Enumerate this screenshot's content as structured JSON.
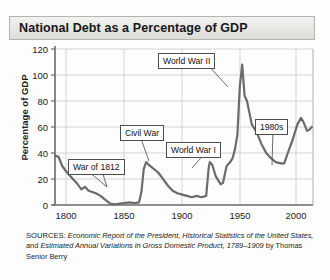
{
  "title": "National Debt as a Percentage of GDP",
  "axes": {
    "ylabel": "Percentage of GDP",
    "yticks": [
      "0",
      "20",
      "40",
      "60",
      "80",
      "100",
      "120"
    ],
    "xticks": [
      "1800",
      "1850",
      "1900",
      "1950",
      "2000"
    ]
  },
  "annotations": [
    {
      "id": "war-of-1812",
      "label": "War of 1812"
    },
    {
      "id": "civil-war",
      "label": "Civil War"
    },
    {
      "id": "world-war-i",
      "label": "World War I"
    },
    {
      "id": "world-war-ii",
      "label": "World War II"
    },
    {
      "id": "nineteen-eighties",
      "label": "1980s"
    }
  ],
  "sources": {
    "label": "SOURCES:",
    "item1": "Economic Report of the President, Historical Statistics of the United States,",
    "conj": " and ",
    "item2": "Estimated Annual Variations in Gross Domestic Product, 1789–1909",
    "tail": " by Thomas Senior Berry"
  },
  "colors": {
    "line": "#6b6b6b",
    "grid": "#c9c9c9",
    "axis": "#6a6a6a",
    "frame": "#9a9a9a",
    "title_text": "#17171a"
  },
  "chart_data": {
    "type": "line",
    "title": "National Debt as a Percentage of GDP",
    "xlabel": "",
    "ylabel": "Percentage of GDP",
    "xlim": [
      1790,
      2005
    ],
    "ylim": [
      0,
      120
    ],
    "grid": true,
    "legend": "none",
    "series": [
      {
        "name": "National debt as % of GDP",
        "x": [
          1790,
          1793,
          1796,
          1800,
          1804,
          1808,
          1812,
          1815,
          1818,
          1821,
          1824,
          1828,
          1832,
          1836,
          1840,
          1844,
          1848,
          1852,
          1856,
          1860,
          1862,
          1864,
          1866,
          1868,
          1872,
          1876,
          1880,
          1884,
          1888,
          1892,
          1896,
          1900,
          1904,
          1908,
          1912,
          1916,
          1918,
          1919,
          1921,
          1924,
          1928,
          1930,
          1933,
          1936,
          1938,
          1940,
          1942,
          1944,
          1946,
          1948,
          1950,
          1954,
          1958,
          1962,
          1966,
          1970,
          1974,
          1978,
          1981,
          1984,
          1988,
          1992,
          1995,
          1997,
          2000,
          2002,
          2004
        ],
        "y": [
          38,
          37,
          30,
          25,
          21,
          17,
          12,
          14,
          11,
          10,
          9,
          7,
          4,
          1,
          0.5,
          1,
          1.5,
          2,
          1.5,
          2,
          10,
          28,
          33,
          31,
          28,
          25,
          20,
          15,
          11,
          9,
          8,
          7,
          6,
          7,
          6,
          7,
          28,
          33,
          31,
          22,
          16,
          17,
          30,
          33,
          36,
          43,
          54,
          91,
          108,
          84,
          80,
          62,
          56,
          47,
          40,
          36,
          33,
          32,
          32,
          40,
          50,
          62,
          67,
          64,
          57,
          58,
          60
        ]
      }
    ],
    "annotations": [
      {
        "label": "War of 1812",
        "points_to_x": 1814,
        "points_to_y": 12
      },
      {
        "label": "Civil War",
        "points_to_x": 1864,
        "points_to_y": 31
      },
      {
        "label": "World War I",
        "points_to_x": 1919,
        "points_to_y": 32
      },
      {
        "label": "World War II",
        "points_to_x": 1946,
        "points_to_y": 106
      },
      {
        "label": "1980s",
        "points_to_x": 1982,
        "points_to_y": 33
      }
    ]
  }
}
